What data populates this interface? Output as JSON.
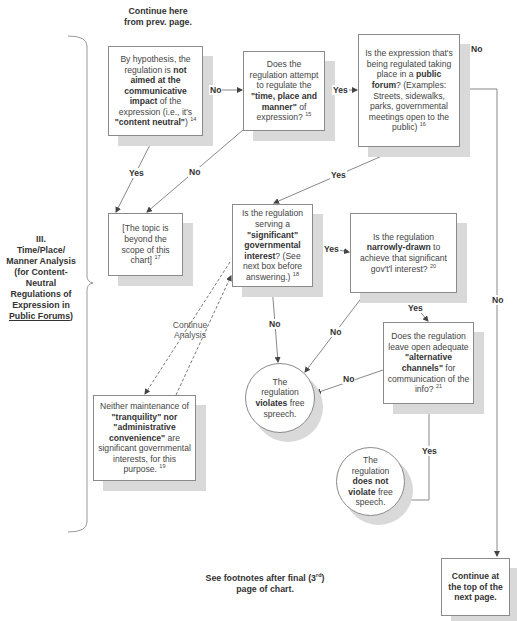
{
  "header": {
    "continue_from": "Continue here from prev. page."
  },
  "section": {
    "number": "III.",
    "title_line1": "Time/Place/",
    "title_line2": "Manner Analysis",
    "title_line3": "(for Content-",
    "title_line4": "Neutral",
    "title_line5": "Regulations of",
    "title_line6": "Expression in",
    "title_underlined": "Public Forums",
    "title_close": ")"
  },
  "nodes": {
    "content_neutral": {
      "t1": "By hypothesis, the regulation is ",
      "b1": "not aimed at the communicative impact",
      "t2": " of the expression (i.e., it's ",
      "b2": "\"content neutral\"",
      "t3": ") ",
      "fn": "14"
    },
    "time_place_manner": {
      "t1": "Does the regulation attempt to regulate the ",
      "b1": "\"time, place and manner\"",
      "t2": " of expression? ",
      "fn": "15"
    },
    "public_forum": {
      "t1": "Is the expression that's being regulated taking place in a ",
      "b1": "public forum",
      "t2": "? (Examples: Streets, sidewalks, parks, governmental meetings open to the public) ",
      "fn": "16"
    },
    "beyond_scope": {
      "t1": "[The topic is beyond the scope of this chart] ",
      "fn": "17"
    },
    "significant_interest": {
      "t1": "Is the regulation serving a ",
      "b1": "\"significant\" governmental interest",
      "t2": "? (See next box before answering.) ",
      "fn": "18"
    },
    "narrowly_drawn": {
      "t1": "Is the regulation ",
      "b1": "narrowly-drawn",
      "t2": " to achieve that significant gov't'l interest? ",
      "fn": "20"
    },
    "alternative_channels": {
      "t1": "Does the regulation leave open adequate ",
      "b1": "\"alternative channels\"",
      "t2": " for communication of the info? ",
      "fn": "21"
    },
    "not_significant": {
      "t1": "Neither maintenance of ",
      "b1": "\"tranquility\" nor \"administrative convenience\"",
      "t2": "  are significant governmental interests, for this purpose. ",
      "fn": "19"
    },
    "violates": {
      "t1": "The regulation ",
      "b1": "violates",
      "t2": " free spreech."
    },
    "does_not_violate": {
      "t1": "The regulation ",
      "b1": "does not violate",
      "t2": " free speech."
    },
    "continue_next": {
      "b1": "Continue at the top of the next page."
    }
  },
  "edge_labels": {
    "no_1": "No",
    "yes_1": "Yes",
    "no_forum": "No",
    "yes_scope": "Yes",
    "no_scope": "No",
    "yes_forum": "Yes",
    "yes_sig": "Yes",
    "no_sig": "No",
    "no_narrow": "No",
    "yes_narrow": "Yes",
    "no_alt": "No",
    "yes_alt": "Yes",
    "no_long": "No",
    "continue_analysis": "Continue Analysis"
  },
  "footer": {
    "note_pre": "See footnotes after final (3",
    "note_sup": "rd",
    "note_post": ") page of chart."
  }
}
